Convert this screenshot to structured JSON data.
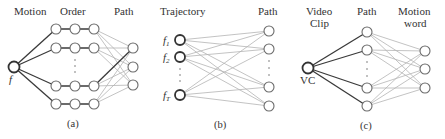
{
  "figure": {
    "panels": [
      {
        "id": "a",
        "caption": "(a)",
        "column_labels": [
          "Motion",
          "Order",
          "Path"
        ],
        "source_node": {
          "label": "f",
          "x": 14,
          "y": 67
        },
        "order_rows_y": [
          29,
          48,
          86,
          104
        ],
        "order_cols_x": [
          56,
          75,
          94
        ],
        "path_nodes": {
          "x": 133,
          "y": [
            48,
            67,
            85
          ]
        },
        "highlight_edge": {
          "from_row": 2,
          "to_path": 0
        }
      },
      {
        "id": "b",
        "caption": "(b)",
        "column_labels": [
          "Trajectory",
          "Path"
        ],
        "trajectory_labels": [
          "f1",
          "f2",
          "fT"
        ],
        "trajectory_nodes": {
          "x": 180,
          "y": [
            40,
            57,
            95
          ]
        },
        "path_nodes": {
          "x": 269,
          "y": [
            31,
            49,
            87,
            106
          ]
        }
      },
      {
        "id": "c",
        "caption": "(c)",
        "column_labels": [
          "Video Clip",
          "Path",
          "Motion word"
        ],
        "source_node": {
          "label": "VC",
          "x": 308,
          "y": 68
        },
        "path_nodes": {
          "x": 367,
          "y": [
            32,
            50,
            88,
            106
          ]
        },
        "motion_word_nodes": {
          "x": 425,
          "y": [
            51,
            69,
            88
          ]
        }
      }
    ],
    "labels": {
      "a_motion": "Motion",
      "a_order": "Order",
      "a_path": "Path",
      "a_f": "f",
      "a_caption": "(a)",
      "b_trajectory": "Trajectory",
      "b_path": "Path",
      "b_f": "f",
      "b_sub1": "1",
      "b_sub2": "2",
      "b_subT": "T",
      "b_caption": "(b)",
      "c_video": "Video",
      "c_clip": "Clip",
      "c_path": "Path",
      "c_motion": "Motion",
      "c_word": "word",
      "c_vc": "VC",
      "c_caption": "(c)"
    }
  }
}
